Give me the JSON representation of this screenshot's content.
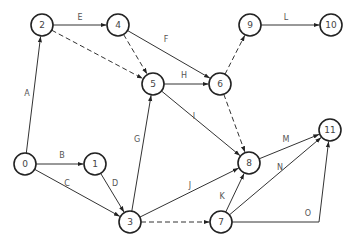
{
  "diagram": {
    "type": "activity-network",
    "node_radius": 11,
    "nodes": [
      {
        "id": "0",
        "label": "0",
        "x": 25,
        "y": 164
      },
      {
        "id": "1",
        "label": "1",
        "x": 95,
        "y": 164
      },
      {
        "id": "2",
        "label": "2",
        "x": 42,
        "y": 25
      },
      {
        "id": "3",
        "label": "3",
        "x": 130,
        "y": 222
      },
      {
        "id": "4",
        "label": "4",
        "x": 118,
        "y": 25
      },
      {
        "id": "5",
        "label": "5",
        "x": 153,
        "y": 84
      },
      {
        "id": "6",
        "label": "6",
        "x": 220,
        "y": 84
      },
      {
        "id": "7",
        "label": "7",
        "x": 221,
        "y": 222
      },
      {
        "id": "8",
        "label": "8",
        "x": 249,
        "y": 163
      },
      {
        "id": "9",
        "label": "9",
        "x": 250,
        "y": 25
      },
      {
        "id": "10",
        "label": "10",
        "x": 331,
        "y": 25
      },
      {
        "id": "11",
        "label": "11",
        "x": 330,
        "y": 130
      }
    ],
    "edges": [
      {
        "from": "0",
        "to": "2",
        "label": "A",
        "style": "solid",
        "lx": 27,
        "ly": 93
      },
      {
        "from": "0",
        "to": "1",
        "label": "B",
        "style": "solid",
        "lx": 62,
        "ly": 155
      },
      {
        "from": "0",
        "to": "3",
        "label": "C",
        "style": "solid",
        "lx": 67,
        "ly": 183
      },
      {
        "from": "1",
        "to": "3",
        "label": "D",
        "style": "solid",
        "lx": 115,
        "ly": 183
      },
      {
        "from": "2",
        "to": "4",
        "label": "E",
        "style": "solid",
        "lx": 80,
        "ly": 17
      },
      {
        "from": "2",
        "to": "5",
        "label": "",
        "style": "dashed"
      },
      {
        "from": "4",
        "to": "6",
        "label": "F",
        "style": "solid",
        "lx": 166,
        "ly": 39
      },
      {
        "from": "4",
        "to": "5",
        "label": "",
        "style": "dashed"
      },
      {
        "from": "3",
        "to": "5",
        "label": "G",
        "style": "solid",
        "lx": 137,
        "ly": 139
      },
      {
        "from": "5",
        "to": "6",
        "label": "H",
        "style": "solid",
        "lx": 184,
        "ly": 75
      },
      {
        "from": "5",
        "to": "8",
        "label": "I",
        "style": "solid",
        "lx": 194,
        "ly": 116
      },
      {
        "from": "6",
        "to": "9",
        "label": "",
        "style": "dashed"
      },
      {
        "from": "6",
        "to": "8",
        "label": "",
        "style": "dashed"
      },
      {
        "from": "3",
        "to": "8",
        "label": "J",
        "style": "solid",
        "lx": 190,
        "ly": 185
      },
      {
        "from": "7",
        "to": "8",
        "label": "K",
        "style": "solid",
        "lx": 222,
        "ly": 196
      },
      {
        "from": "9",
        "to": "10",
        "label": "L",
        "style": "solid",
        "lx": 286,
        "ly": 17
      },
      {
        "from": "8",
        "to": "11",
        "label": "M",
        "style": "solid",
        "lx": 286,
        "ly": 139
      },
      {
        "from": "7",
        "to": "11",
        "label": "N",
        "style": "solid",
        "lx": 280,
        "ly": 167
      },
      {
        "from": "3",
        "to": "7",
        "label": "",
        "style": "dashed"
      },
      {
        "from": "7",
        "to": "11",
        "label": "O",
        "style": "solid",
        "via": [
          [
            319,
            222
          ]
        ],
        "lx": 308,
        "ly": 213
      }
    ]
  }
}
